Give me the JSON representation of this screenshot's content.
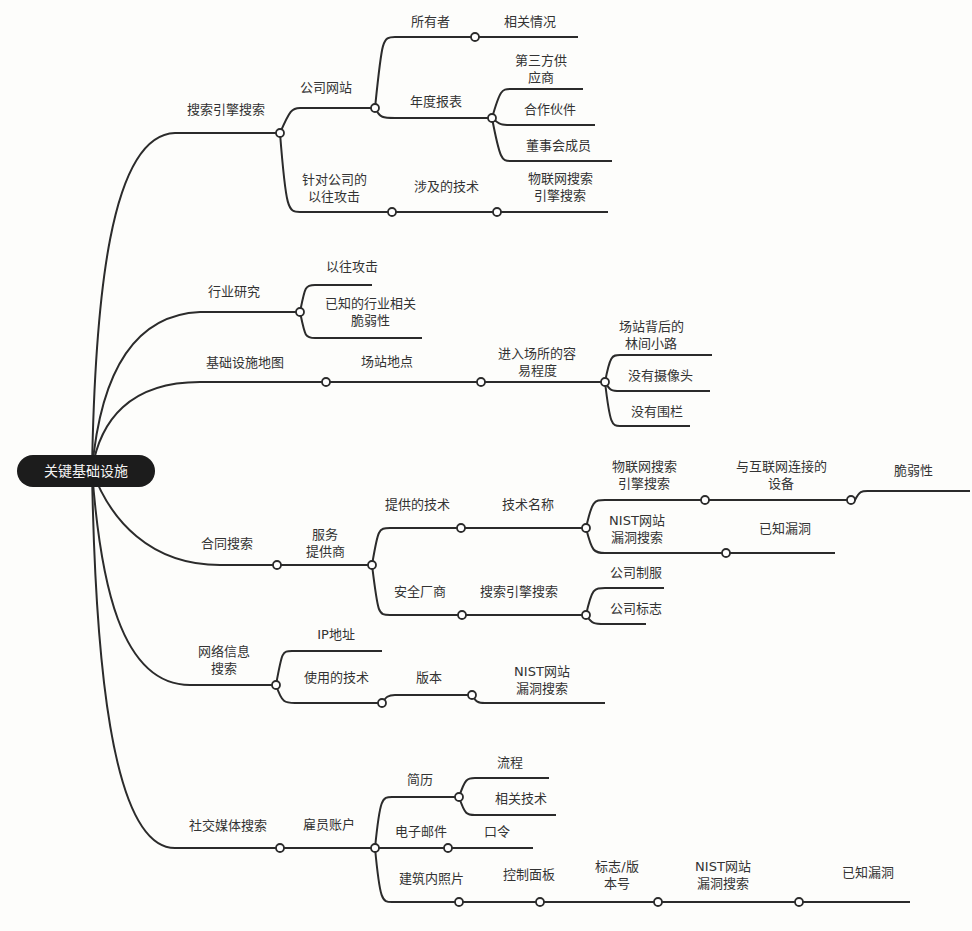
{
  "root": {
    "label": "关键基础设施"
  },
  "branches": [
    {
      "label": "搜索引擎搜索",
      "children": [
        {
          "label": "公司网站",
          "children": [
            {
              "label": "所有者",
              "children": [
                {
                  "label": "相关情况"
                }
              ]
            },
            {
              "label": "年度报表",
              "children": [
                {
                  "label": "第三方供\n应商"
                },
                {
                  "label": "合作伙件"
                },
                {
                  "label": "董事会成员"
                }
              ]
            }
          ]
        },
        {
          "label": "针对公司的\n以往攻击",
          "children": [
            {
              "label": "涉及的技术",
              "children": [
                {
                  "label": "物联网搜索\n引擎搜索"
                }
              ]
            }
          ]
        }
      ]
    },
    {
      "label": "行业研究",
      "children": [
        {
          "label": "以往攻击"
        },
        {
          "label": "已知的行业相关\n脆弱性"
        }
      ]
    },
    {
      "label": "基础设施地图",
      "children": [
        {
          "label": "场站地点",
          "children": [
            {
              "label": "进入场所的容\n易程度",
              "children": [
                {
                  "label": "场站背后的\n林间小路"
                },
                {
                  "label": "没有摄像头"
                },
                {
                  "label": "没有围栏"
                }
              ]
            }
          ]
        }
      ]
    },
    {
      "label": "合同搜索",
      "children": [
        {
          "label": "服务\n提供商",
          "children": [
            {
              "label": "提供的技术",
              "children": [
                {
                  "label": "技术名称",
                  "children": [
                    {
                      "label": "物联网搜索\n引擎搜索",
                      "children": [
                        {
                          "label": "与互联网连接的\n设备",
                          "children": [
                            {
                              "label": "脆弱性"
                            }
                          ]
                        }
                      ]
                    },
                    {
                      "label": "NIST网站\n漏洞搜索",
                      "children": [
                        {
                          "label": "已知漏洞"
                        }
                      ]
                    }
                  ]
                }
              ]
            },
            {
              "label": "安全厂商",
              "children": [
                {
                  "label": "搜索引擎搜索",
                  "children": [
                    {
                      "label": "公司制服"
                    },
                    {
                      "label": "公司标志"
                    }
                  ]
                }
              ]
            }
          ]
        }
      ]
    },
    {
      "label": "网络信息\n搜索",
      "children": [
        {
          "label": "IP地址"
        },
        {
          "label": "使用的技术",
          "children": [
            {
              "label": "版本",
              "children": [
                {
                  "label": "NIST网站\n漏洞搜索"
                }
              ]
            }
          ]
        }
      ]
    },
    {
      "label": "社交媒体搜索",
      "children": [
        {
          "label": "雇员账户",
          "children": [
            {
              "label": "简历",
              "children": [
                {
                  "label": "流程"
                },
                {
                  "label": "相关技术"
                }
              ]
            },
            {
              "label": "电子邮件",
              "children": [
                {
                  "label": "口令"
                }
              ]
            },
            {
              "label": "建筑内照片",
              "children": [
                {
                  "label": "控制面板",
                  "children": [
                    {
                      "label": "标志/版\n本号",
                      "children": [
                        {
                          "label": "NIST网站\n漏洞搜索",
                          "children": [
                            {
                              "label": "已知漏洞"
                            }
                          ]
                        }
                      ]
                    }
                  ]
                }
              ]
            }
          ]
        }
      ]
    }
  ],
  "colors": {
    "line": "#2b2b2b",
    "root_bg": "#1c1c1c",
    "root_text": "#f4f4f4",
    "background": "#fdfdfb"
  }
}
